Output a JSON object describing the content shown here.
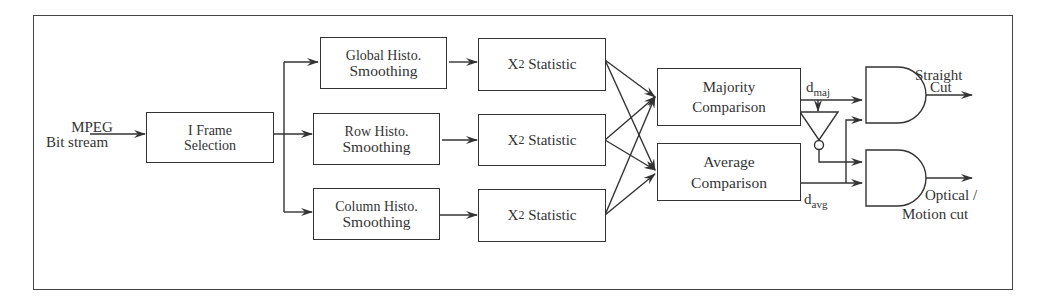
{
  "diagram": {
    "type": "block-diagram",
    "input": {
      "line1": "MPEG",
      "line2": "Bit stream"
    },
    "nodes": {
      "iframe": {
        "line1": "I Frame",
        "line2": "Selection"
      },
      "global": {
        "line1": "Global Histo.",
        "line2": "Smoothing"
      },
      "row": {
        "line1": "Row Histo.",
        "line2": "Smoothing"
      },
      "column": {
        "line1": "Column Histo.",
        "line2": "Smoothing"
      },
      "chi1": {
        "symbol": "X",
        "exponent": "2",
        "text": "Statistic"
      },
      "chi2": {
        "symbol": "X",
        "exponent": "2",
        "text": "Statistic"
      },
      "chi3": {
        "symbol": "X",
        "exponent": "2",
        "text": "Statistic"
      },
      "majority": {
        "line1": "Majority",
        "line2": "Comparison"
      },
      "average": {
        "line1": "Average",
        "line2": "Comparison"
      },
      "not_gate": {
        "type": "NOT"
      },
      "and_top": {
        "type": "AND"
      },
      "and_bottom": {
        "type": "AND"
      }
    },
    "signals": {
      "d_maj": {
        "base": "d",
        "sub": "maj"
      },
      "d_avg": {
        "base": "d",
        "sub": "avg"
      }
    },
    "outputs": {
      "straight": {
        "line1": "Straight",
        "line2": "Cut"
      },
      "optical": {
        "line1": "Optical /",
        "line2": "Motion cut"
      }
    },
    "edges": [
      [
        "input",
        "iframe"
      ],
      [
        "iframe",
        "global"
      ],
      [
        "iframe",
        "row"
      ],
      [
        "iframe",
        "column"
      ],
      [
        "global",
        "chi1"
      ],
      [
        "row",
        "chi2"
      ],
      [
        "column",
        "chi3"
      ],
      [
        "chi1",
        "majority"
      ],
      [
        "chi1",
        "average"
      ],
      [
        "chi2",
        "majority"
      ],
      [
        "chi2",
        "average"
      ],
      [
        "chi3",
        "majority"
      ],
      [
        "chi3",
        "average"
      ],
      [
        "majority",
        "and_top"
      ],
      [
        "majority",
        "not_gate"
      ],
      [
        "not_gate",
        "and_bottom"
      ],
      [
        "average",
        "and_top"
      ],
      [
        "average",
        "and_bottom"
      ],
      [
        "and_top",
        "straight"
      ],
      [
        "and_bottom",
        "optical"
      ]
    ],
    "colors": {
      "stroke": "#333333",
      "background": "#ffffff"
    }
  }
}
